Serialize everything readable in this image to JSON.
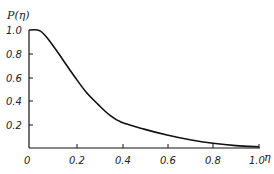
{
  "chart_data": {
    "type": "line",
    "title": "",
    "xlabel": "η",
    "ylabel": "P(η)",
    "xlim": [
      0,
      1.0
    ],
    "ylim": [
      0,
      1.0
    ],
    "grid": false,
    "legend": null,
    "x_ticks": [
      "0",
      "0.2",
      "0.4",
      "0.6",
      "0.8",
      "1.0"
    ],
    "y_ticks": [
      "0.2",
      "0.4",
      "0.6",
      "0.8",
      "1.0"
    ],
    "series": [
      {
        "name": "P(η)",
        "x": [
          0,
          0.05,
          0.1,
          0.15,
          0.2,
          0.25,
          0.3,
          0.35,
          0.4,
          0.5,
          0.6,
          0.7,
          0.8,
          0.9,
          1.0
        ],
        "values": [
          1.0,
          0.99,
          0.88,
          0.74,
          0.6,
          0.47,
          0.37,
          0.28,
          0.22,
          0.16,
          0.11,
          0.07,
          0.04,
          0.02,
          0.01
        ]
      }
    ]
  },
  "labels": {
    "ylabel": "P(η)",
    "xlabel": "η",
    "x0": "0",
    "x1": "0.2",
    "x2": "0.4",
    "x3": "0.6",
    "x4": "0.8",
    "x5": "1.0",
    "y1": "0.2",
    "y2": "0.4",
    "y3": "0.6",
    "y4": "0.8",
    "y5": "1.0"
  }
}
